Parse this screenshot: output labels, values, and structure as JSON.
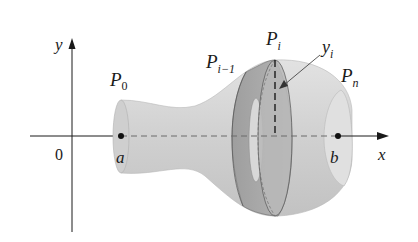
{
  "diagram": {
    "type": "surface-of-revolution",
    "axes": {
      "x_label": "x",
      "y_label": "y",
      "origin_label": "0"
    },
    "points": {
      "start": {
        "label": "P",
        "subscript": "0",
        "axis_label": "a"
      },
      "end": {
        "label": "P",
        "subscript": "n",
        "axis_label": "b"
      },
      "prev": {
        "label": "P",
        "subscript": "i−1"
      },
      "current": {
        "label": "P",
        "subscript": "i"
      }
    },
    "radius_label": {
      "label": "y",
      "subscript": "i"
    },
    "colors": {
      "surface": "#d4d4d4",
      "surface_dark": "#bdbdbd",
      "band": "#a8a8a8",
      "band_inner": "#c4c4c4",
      "axis": "#1a1a1a"
    }
  }
}
